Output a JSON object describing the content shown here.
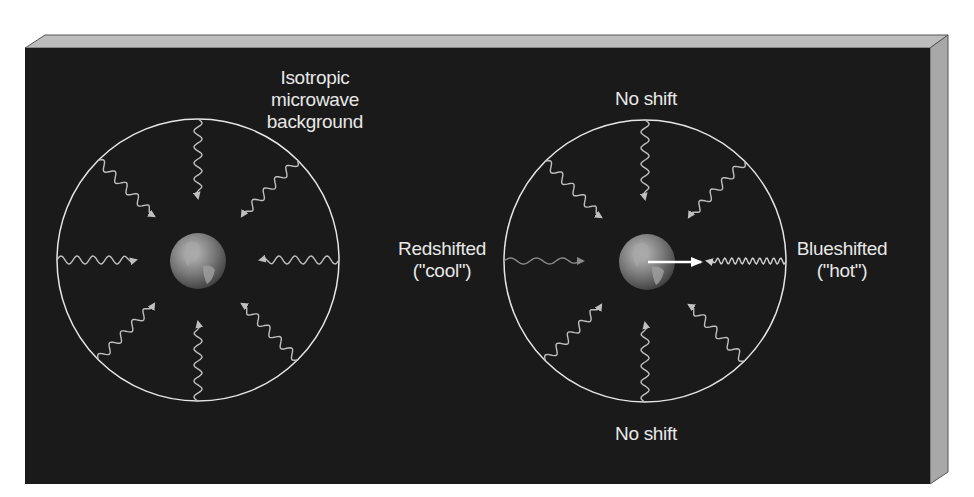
{
  "colors": {
    "page_bg": "#ffffff",
    "panel_front": "#1a1a1a",
    "panel_top": "#bdbdbd",
    "panel_side": "#a8a8a8",
    "circle_stroke": "#e6e6e6",
    "wave_normal": "#bfbfbf",
    "wave_redshifted": "#8a8a8a",
    "wave_blueshifted": "#d0d0d0",
    "label_text": "#e8e8e8",
    "motion_arrow": "#ffffff"
  },
  "left_panel": {
    "title_line1": "Isotropic",
    "title_line2": "microwave",
    "title_line3": "background"
  },
  "right_panel": {
    "top_label": "No shift",
    "bottom_label": "No shift",
    "left_label_line1": "Redshifted",
    "left_label_line2": "(\"cool\")",
    "right_label_line1": "Blueshifted",
    "right_label_line2": "(\"hot\")"
  },
  "geometry": {
    "left_circle": {
      "cx": 198,
      "cy": 260,
      "r": 141
    },
    "right_circle": {
      "cx": 645,
      "cy": 261,
      "r": 141
    },
    "earth_radius": 28,
    "num_rays": 8
  }
}
